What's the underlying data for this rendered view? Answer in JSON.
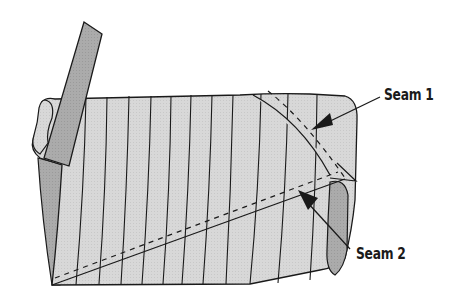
{
  "diagram": {
    "type": "fabric-tube-seams",
    "labels": {
      "seam1": "Seam 1",
      "seam2": "Seam 2"
    },
    "colors": {
      "fabric_light": "#d6d6d6",
      "fabric_dark": "#a9a9a9",
      "outline": "#1a1a1a",
      "background": "#ffffff"
    }
  }
}
